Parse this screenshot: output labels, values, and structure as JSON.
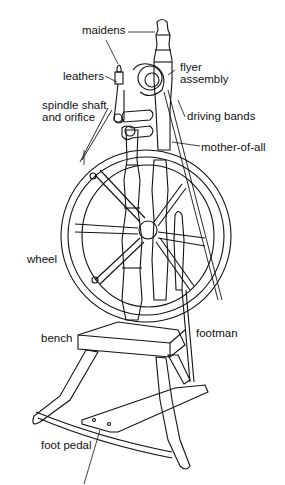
{
  "diagram": {
    "labels": {
      "maidens": "maidens",
      "flyer_assembly_1": "flyer",
      "flyer_assembly_2": "assembly",
      "leathers": "leathers",
      "spindle_1": "spindle shaft",
      "spindle_2": "and orifice",
      "driving_bands": "driving bands",
      "mother_of_all": "mother-of-all",
      "wheel": "wheel",
      "bench": "bench",
      "footman": "footman",
      "foot_pedal": "foot pedal"
    },
    "colors": {
      "line": "#111111",
      "background": "#ffffff"
    }
  }
}
